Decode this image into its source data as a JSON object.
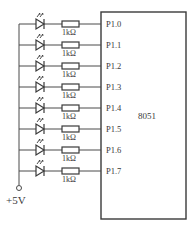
{
  "diagram": {
    "chip": {
      "label": "8051"
    },
    "supply": {
      "label": "+5V"
    },
    "rows": [
      {
        "port": "P1.0",
        "resistor": "1kΩ"
      },
      {
        "port": "P1.1",
        "resistor": "1kΩ"
      },
      {
        "port": "P1.2",
        "resistor": "1kΩ"
      },
      {
        "port": "P1.3",
        "resistor": "1kΩ"
      },
      {
        "port": "P1.4",
        "resistor": "1kΩ"
      },
      {
        "port": "P1.5",
        "resistor": "1kΩ"
      },
      {
        "port": "P1.6",
        "resistor": "1kΩ"
      },
      {
        "port": "P1.7",
        "resistor": "1kΩ"
      }
    ],
    "colors": {
      "line": "#4a4a4a",
      "text": "#3a3a3a",
      "background": "#ffffff"
    }
  }
}
